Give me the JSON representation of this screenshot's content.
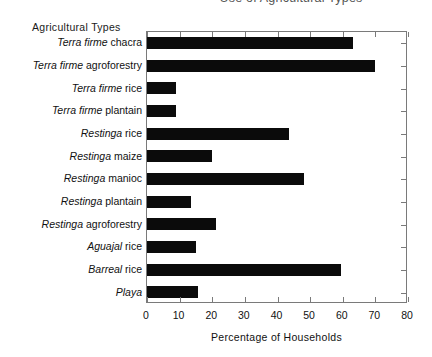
{
  "chart_data": {
    "type": "bar",
    "orientation": "horizontal",
    "title": "Use of Agricultural Types",
    "xlabel": "Percentage of Households",
    "ylabel": "Agricultural Types",
    "xlim": [
      0,
      80
    ],
    "xticks": [
      0,
      10,
      20,
      30,
      40,
      50,
      60,
      70,
      80
    ],
    "grid": false,
    "legend": false,
    "bar_color": "#0b0b0b",
    "categories": [
      "Terra firme chacra",
      "Terra firme agroforestry",
      "Terra firme rice",
      "Terra firme plantain",
      "Restinga rice",
      "Restinga maize",
      "Restinga manioc",
      "Restinga plantain",
      "Restinga agroforestry",
      "Aguajal rice",
      "Barreal rice",
      "Playa"
    ],
    "category_parts": [
      {
        "italic": "Terra firme",
        "roman": "chacra"
      },
      {
        "italic": "Terra firme",
        "roman": "agroforestry"
      },
      {
        "italic": "Terra firme",
        "roman": "rice"
      },
      {
        "italic": "Terra firme",
        "roman": "plantain"
      },
      {
        "italic": "Restinga",
        "roman": "rice"
      },
      {
        "italic": "Restinga",
        "roman": "maize"
      },
      {
        "italic": "Restinga",
        "roman": "manioc"
      },
      {
        "italic": "Restinga",
        "roman": "plantain"
      },
      {
        "italic": "Restinga",
        "roman": "agroforestry"
      },
      {
        "italic": "Aguajal",
        "roman": "rice"
      },
      {
        "italic": "Barreal",
        "roman": "rice"
      },
      {
        "italic": "Playa",
        "roman": ""
      }
    ],
    "values": [
      63,
      70,
      9,
      9,
      43.5,
      20,
      48,
      13.5,
      21,
      15,
      59.5,
      15.5
    ]
  }
}
